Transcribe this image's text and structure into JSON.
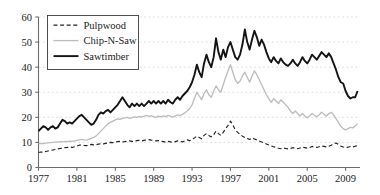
{
  "chart_data": {
    "type": "line",
    "title": "",
    "subtitle": "",
    "xlabel": "",
    "ylabel": "",
    "xlim": [
      1977,
      2010.5
    ],
    "ylim": [
      0,
      60
    ],
    "grid": true,
    "grid_style": "dotted-horizontal",
    "legend_position": "top-left",
    "x_ticks": [
      1977,
      1981,
      1985,
      1989,
      1993,
      1997,
      2001,
      2005,
      2009
    ],
    "x_tick_labels": [
      "1977",
      "1981",
      "1985",
      "1989",
      "1993",
      "1997",
      "2001",
      "2005",
      "2009"
    ],
    "y_ticks": [
      0,
      10,
      20,
      30,
      40,
      50,
      60
    ],
    "y_tick_labels": [
      "0",
      "10",
      "20",
      "30",
      "40",
      "50",
      "60"
    ],
    "colors": {
      "pulpwood": "#222222",
      "chipnsaw": "#bdbdbd",
      "sawtimber": "#141414",
      "axis": "#6b6b6b",
      "grid": "#d9d2cc",
      "background": "#ffffff"
    },
    "x": [
      1977.0,
      1977.25,
      1977.5,
      1977.75,
      1978.0,
      1978.25,
      1978.5,
      1978.75,
      1979.0,
      1979.25,
      1979.5,
      1979.75,
      1980.0,
      1980.25,
      1980.5,
      1980.75,
      1981.0,
      1981.25,
      1981.5,
      1981.75,
      1982.0,
      1982.25,
      1982.5,
      1982.75,
      1983.0,
      1983.25,
      1983.5,
      1983.75,
      1984.0,
      1984.25,
      1984.5,
      1984.75,
      1985.0,
      1985.25,
      1985.5,
      1985.75,
      1986.0,
      1986.25,
      1986.5,
      1986.75,
      1987.0,
      1987.25,
      1987.5,
      1987.75,
      1988.0,
      1988.25,
      1988.5,
      1988.75,
      1989.0,
      1989.25,
      1989.5,
      1989.75,
      1990.0,
      1990.25,
      1990.5,
      1990.75,
      1991.0,
      1991.25,
      1991.5,
      1991.75,
      1992.0,
      1992.25,
      1992.5,
      1992.75,
      1993.0,
      1993.25,
      1993.5,
      1993.75,
      1994.0,
      1994.25,
      1994.5,
      1994.75,
      1995.0,
      1995.25,
      1995.5,
      1995.75,
      1996.0,
      1996.25,
      1996.5,
      1996.75,
      1997.0,
      1997.25,
      1997.5,
      1997.75,
      1998.0,
      1998.25,
      1998.5,
      1998.75,
      1999.0,
      1999.25,
      1999.5,
      1999.75,
      2000.0,
      2000.25,
      2000.5,
      2000.75,
      2001.0,
      2001.25,
      2001.5,
      2001.75,
      2002.0,
      2002.25,
      2002.5,
      2002.75,
      2003.0,
      2003.25,
      2003.5,
      2003.75,
      2004.0,
      2004.25,
      2004.5,
      2004.75,
      2005.0,
      2005.25,
      2005.5,
      2005.75,
      2006.0,
      2006.25,
      2006.5,
      2006.75,
      2007.0,
      2007.25,
      2007.5,
      2007.75,
      2008.0,
      2008.25,
      2008.5,
      2008.75,
      2009.0,
      2009.25,
      2009.5,
      2009.75,
      2010.0,
      2010.25
    ],
    "series": [
      {
        "name": "Pulpwood",
        "style": "dashed",
        "color": "#222222",
        "values": [
          6.0,
          6.2,
          6.1,
          6.4,
          6.6,
          6.8,
          7.0,
          7.2,
          7.4,
          7.6,
          7.8,
          7.9,
          8.0,
          8.2,
          8.0,
          8.3,
          8.6,
          8.9,
          9.0,
          8.8,
          8.7,
          8.9,
          9.2,
          9.0,
          9.1,
          9.3,
          9.5,
          9.4,
          9.6,
          9.8,
          10.0,
          9.9,
          10.1,
          10.3,
          10.4,
          10.2,
          10.3,
          10.5,
          10.6,
          10.4,
          10.5,
          10.7,
          10.8,
          10.6,
          10.8,
          11.0,
          11.1,
          10.9,
          10.8,
          10.6,
          10.7,
          10.5,
          10.3,
          10.1,
          10.4,
          10.2,
          10.0,
          10.3,
          10.6,
          10.4,
          10.2,
          10.6,
          11.0,
          10.7,
          11.2,
          11.8,
          12.5,
          12.0,
          11.5,
          12.8,
          13.5,
          12.8,
          12.2,
          13.0,
          14.5,
          13.5,
          12.8,
          14.0,
          15.5,
          16.8,
          18.5,
          17.0,
          15.0,
          14.0,
          13.2,
          12.5,
          12.0,
          11.6,
          11.2,
          11.8,
          11.4,
          11.0,
          10.6,
          10.2,
          9.8,
          9.4,
          9.0,
          8.6,
          8.3,
          8.0,
          7.7,
          7.5,
          7.8,
          7.6,
          7.4,
          7.6,
          7.9,
          7.7,
          7.5,
          7.8,
          8.1,
          7.9,
          7.7,
          8.0,
          8.4,
          8.2,
          8.0,
          8.3,
          8.6,
          8.4,
          8.2,
          8.5,
          8.9,
          9.4,
          9.8,
          9.2,
          8.6,
          8.2,
          7.9,
          8.1,
          8.4,
          8.2,
          8.5,
          8.7
        ]
      },
      {
        "name": "Chip-N-Saw",
        "style": "solid",
        "color": "#bdbdbd",
        "values": [
          9.5,
          9.6,
          9.5,
          9.7,
          9.8,
          9.9,
          10.0,
          10.1,
          10.2,
          10.3,
          10.2,
          10.4,
          10.3,
          10.5,
          10.4,
          10.6,
          10.8,
          11.0,
          11.2,
          11.0,
          10.9,
          11.2,
          11.6,
          12.0,
          12.5,
          13.5,
          14.5,
          15.5,
          16.5,
          17.5,
          18.0,
          18.5,
          19.0,
          19.4,
          19.2,
          19.6,
          19.8,
          20.0,
          19.6,
          19.9,
          20.2,
          20.0,
          20.4,
          20.1,
          20.5,
          20.8,
          20.4,
          20.7,
          20.3,
          20.0,
          20.5,
          20.2,
          20.6,
          20.3,
          20.8,
          20.5,
          20.1,
          20.6,
          21.0,
          20.7,
          21.2,
          21.8,
          22.5,
          23.5,
          25.0,
          27.5,
          30.0,
          28.5,
          27.0,
          29.5,
          31.0,
          29.0,
          28.0,
          30.5,
          32.5,
          31.0,
          30.0,
          33.0,
          36.0,
          38.5,
          41.0,
          38.0,
          35.0,
          33.5,
          34.5,
          36.5,
          38.0,
          36.0,
          34.0,
          36.5,
          38.5,
          37.0,
          35.0,
          33.0,
          31.0,
          29.0,
          27.5,
          26.0,
          27.5,
          26.5,
          25.5,
          27.0,
          26.0,
          25.0,
          24.0,
          22.5,
          21.5,
          22.5,
          21.5,
          20.5,
          21.5,
          20.5,
          19.8,
          20.5,
          21.5,
          20.8,
          20.2,
          21.0,
          22.0,
          21.2,
          20.5,
          21.5,
          22.0,
          21.0,
          19.5,
          18.0,
          16.5,
          15.5,
          15.0,
          15.5,
          16.0,
          15.8,
          16.5,
          17.5
        ]
      },
      {
        "name": "Sawtimber",
        "style": "solid-bold",
        "color": "#141414",
        "values": [
          14.5,
          15.5,
          16.5,
          16.0,
          15.0,
          16.0,
          16.5,
          15.5,
          16.0,
          17.5,
          19.0,
          18.5,
          17.5,
          18.0,
          17.5,
          18.5,
          19.5,
          20.5,
          21.0,
          20.0,
          19.0,
          18.0,
          17.0,
          17.5,
          19.0,
          21.0,
          22.0,
          21.5,
          22.5,
          23.0,
          22.0,
          23.0,
          24.0,
          25.0,
          26.5,
          28.0,
          26.5,
          25.0,
          24.0,
          25.5,
          24.5,
          25.5,
          24.5,
          25.5,
          24.5,
          25.5,
          26.5,
          25.5,
          26.5,
          25.5,
          26.5,
          25.5,
          26.5,
          25.5,
          27.0,
          26.0,
          25.5,
          27.0,
          28.0,
          27.0,
          28.5,
          29.5,
          30.5,
          32.0,
          34.0,
          37.0,
          41.0,
          38.0,
          36.0,
          41.5,
          45.0,
          42.0,
          40.0,
          44.0,
          51.5,
          46.0,
          43.0,
          47.0,
          44.0,
          48.0,
          50.0,
          47.0,
          44.0,
          43.0,
          45.0,
          49.0,
          55.0,
          50.0,
          47.0,
          51.0,
          54.5,
          52.0,
          48.5,
          51.0,
          49.0,
          46.0,
          43.5,
          42.0,
          44.0,
          42.5,
          41.5,
          43.5,
          42.0,
          41.0,
          40.5,
          41.5,
          43.0,
          41.5,
          40.5,
          42.0,
          44.0,
          42.5,
          41.5,
          43.0,
          45.0,
          44.0,
          43.0,
          44.5,
          46.0,
          45.0,
          44.0,
          45.5,
          44.0,
          41.5,
          39.0,
          36.0,
          34.0,
          33.5,
          30.5,
          28.5,
          27.5,
          28.0,
          28.0,
          30.5
        ]
      }
    ]
  },
  "legend": {
    "items": [
      {
        "label": "Pulpwood",
        "style": "dashed"
      },
      {
        "label": "Chip-N-Saw",
        "style": "solid-light"
      },
      {
        "label": "Sawtimber",
        "style": "solid-bold"
      }
    ]
  }
}
